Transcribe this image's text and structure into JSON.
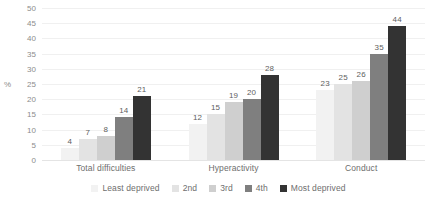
{
  "chart_data": {
    "type": "bar",
    "title": "",
    "subtitle": "",
    "xlabel": "",
    "ylabel": "%",
    "ylim": [
      0,
      50
    ],
    "ytick_step": 5,
    "yticks": [
      "50",
      "45",
      "40",
      "35",
      "30",
      "25",
      "20",
      "15",
      "10",
      "5",
      "0"
    ],
    "grid": true,
    "legend_position": "bottom",
    "categories": [
      "Total difficulties",
      "Hyperactivity",
      "Conduct"
    ],
    "series": [
      {
        "name": "Least deprived",
        "color": "#f2f2f2",
        "values": [
          4,
          12,
          23
        ]
      },
      {
        "name": "2nd",
        "color": "#e3e3e3",
        "values": [
          7,
          15,
          25
        ]
      },
      {
        "name": "3rd",
        "color": "#cfcfcf",
        "values": [
          8,
          19,
          26
        ]
      },
      {
        "name": "4th",
        "color": "#7f7f7f",
        "values": [
          14,
          20,
          35
        ]
      },
      {
        "name": "Most deprived",
        "color": "#333333",
        "values": [
          21,
          28,
          44
        ]
      }
    ]
  },
  "colors": {
    "gridline": "#f0f0f0",
    "baseline": "#e4e4e4",
    "tick_text": "#8c8c8c",
    "label_text": "#6e6e6e",
    "data_label_text": "#606060"
  }
}
